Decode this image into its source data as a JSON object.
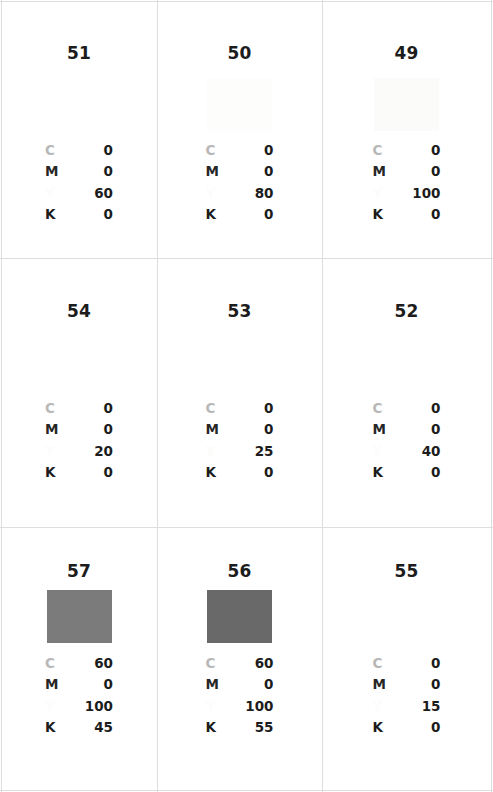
{
  "sheet": {
    "title": "CMYK Color Swatch Reference Sheet",
    "grid_rule_color": "#dedede",
    "background": "#ffffff",
    "columns": 3,
    "rows": 3,
    "channel_labels": {
      "c": "C",
      "m": "M",
      "y": "Y",
      "k": "K"
    },
    "channel_label_colors": {
      "c": "#b8b8b8",
      "m": "#262626",
      "y": "#fcfcfa",
      "k": "#1c1c1c"
    }
  },
  "chart_data": {
    "type": "table",
    "xlabel": "",
    "ylabel": "",
    "columns": [
      "index",
      "C",
      "M",
      "Y",
      "K",
      "swatch_hex"
    ],
    "rows": [
      {
        "index": "51",
        "C": "0",
        "M": "0",
        "Y": "60",
        "K": "0",
        "swatch_hex": "#ffffff"
      },
      {
        "index": "50",
        "C": "0",
        "M": "0",
        "Y": "80",
        "K": "0",
        "swatch_hex": "#fdfdfc"
      },
      {
        "index": "49",
        "C": "0",
        "M": "0",
        "Y": "100",
        "K": "0",
        "swatch_hex": "#fbfbf9"
      },
      {
        "index": "54",
        "C": "0",
        "M": "0",
        "Y": "20",
        "K": "0",
        "swatch_hex": "#ffffff"
      },
      {
        "index": "53",
        "C": "0",
        "M": "0",
        "Y": "25",
        "K": "0",
        "swatch_hex": "#ffffff"
      },
      {
        "index": "52",
        "C": "0",
        "M": "0",
        "Y": "40",
        "K": "0",
        "swatch_hex": "#ffffff"
      },
      {
        "index": "57",
        "C": "60",
        "M": "0",
        "Y": "100",
        "K": "45",
        "swatch_hex": "#7b7b7b"
      },
      {
        "index": "56",
        "C": "60",
        "M": "0",
        "Y": "100",
        "K": "55",
        "swatch_hex": "#696969"
      },
      {
        "index": "55",
        "C": "0",
        "M": "0",
        "Y": "15",
        "K": "0",
        "swatch_hex": "#ffffff"
      }
    ]
  },
  "cells": [
    {
      "index": "51",
      "swatch_hex": "#ffffff",
      "swatch_visible": false,
      "swatch_top": 88,
      "index_top": 45,
      "cmyk_top": 142,
      "channels": [
        {
          "label": "C",
          "value": "0",
          "key": "c"
        },
        {
          "label": "M",
          "value": "0",
          "key": "m"
        },
        {
          "label": "Y",
          "value": "60",
          "key": "y"
        },
        {
          "label": "K",
          "value": "0",
          "key": "k"
        }
      ]
    },
    {
      "index": "50",
      "swatch_hex": "#fdfdfc",
      "swatch_visible": true,
      "swatch_top": 78,
      "index_top": 45,
      "cmyk_top": 142,
      "channels": [
        {
          "label": "C",
          "value": "0",
          "key": "c"
        },
        {
          "label": "M",
          "value": "0",
          "key": "m"
        },
        {
          "label": "Y",
          "value": "80",
          "key": "y"
        },
        {
          "label": "K",
          "value": "0",
          "key": "k"
        }
      ]
    },
    {
      "index": "49",
      "swatch_hex": "#fbfbf9",
      "swatch_visible": true,
      "swatch_top": 78,
      "index_top": 45,
      "cmyk_top": 142,
      "channels": [
        {
          "label": "C",
          "value": "0",
          "key": "c"
        },
        {
          "label": "M",
          "value": "0",
          "key": "m"
        },
        {
          "label": "Y",
          "value": "100",
          "key": "y"
        },
        {
          "label": "K",
          "value": "0",
          "key": "k"
        }
      ]
    },
    {
      "index": "54",
      "swatch_hex": "#ffffff",
      "swatch_visible": false,
      "swatch_top": 345,
      "index_top": 303,
      "cmyk_top": 400,
      "channels": [
        {
          "label": "C",
          "value": "0",
          "key": "c"
        },
        {
          "label": "M",
          "value": "0",
          "key": "m"
        },
        {
          "label": "Y",
          "value": "20",
          "key": "y"
        },
        {
          "label": "K",
          "value": "0",
          "key": "k"
        }
      ]
    },
    {
      "index": "53",
      "swatch_hex": "#ffffff",
      "swatch_visible": false,
      "swatch_top": 345,
      "index_top": 303,
      "cmyk_top": 400,
      "channels": [
        {
          "label": "C",
          "value": "0",
          "key": "c"
        },
        {
          "label": "M",
          "value": "0",
          "key": "m"
        },
        {
          "label": "Y",
          "value": "25",
          "key": "y"
        },
        {
          "label": "K",
          "value": "0",
          "key": "k"
        }
      ]
    },
    {
      "index": "52",
      "swatch_hex": "#ffffff",
      "swatch_visible": false,
      "swatch_top": 345,
      "index_top": 303,
      "cmyk_top": 400,
      "channels": [
        {
          "label": "C",
          "value": "0",
          "key": "c"
        },
        {
          "label": "M",
          "value": "0",
          "key": "m"
        },
        {
          "label": "Y",
          "value": "40",
          "key": "y"
        },
        {
          "label": "K",
          "value": "0",
          "key": "k"
        }
      ]
    },
    {
      "index": "57",
      "swatch_hex": "#7b7b7b",
      "swatch_visible": true,
      "swatch_top": 590,
      "index_top": 563,
      "cmyk_top": 655,
      "channels": [
        {
          "label": "C",
          "value": "60",
          "key": "c"
        },
        {
          "label": "M",
          "value": "0",
          "key": "m"
        },
        {
          "label": "Y",
          "value": "100",
          "key": "y"
        },
        {
          "label": "K",
          "value": "45",
          "key": "k"
        }
      ]
    },
    {
      "index": "56",
      "swatch_hex": "#696969",
      "swatch_visible": true,
      "swatch_top": 590,
      "index_top": 563,
      "cmyk_top": 655,
      "channels": [
        {
          "label": "C",
          "value": "60",
          "key": "c"
        },
        {
          "label": "M",
          "value": "0",
          "key": "m"
        },
        {
          "label": "Y",
          "value": "100",
          "key": "y"
        },
        {
          "label": "K",
          "value": "55",
          "key": "k"
        }
      ]
    },
    {
      "index": "55",
      "swatch_hex": "#ffffff",
      "swatch_visible": false,
      "swatch_top": 590,
      "index_top": 563,
      "cmyk_top": 655,
      "channels": [
        {
          "label": "C",
          "value": "0",
          "key": "c"
        },
        {
          "label": "M",
          "value": "0",
          "key": "m"
        },
        {
          "label": "Y",
          "value": "15",
          "key": "y"
        },
        {
          "label": "K",
          "value": "0",
          "key": "k"
        }
      ]
    }
  ]
}
